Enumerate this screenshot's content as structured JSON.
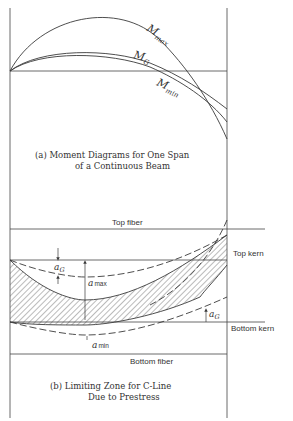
{
  "figure": {
    "part_a": {
      "caption_line1": "(a) Moment Diagrams for One Span",
      "caption_line2": "of a Continuous Beam",
      "curves": [
        {
          "name": "M_max",
          "label_main": "M",
          "label_sub": "max"
        },
        {
          "name": "M_G",
          "label_main": "M",
          "label_sub": "G"
        },
        {
          "name": "M_min",
          "label_main": "M",
          "label_sub": "min"
        }
      ]
    },
    "part_b": {
      "caption_line1": "(b) Limiting Zone for C-Line",
      "caption_line2": "Due to Prestress",
      "levels": {
        "top_fiber": "Top fiber",
        "top_kern": "Top kern",
        "bottom_kern": "Bottom kern",
        "bottom_fiber": "Bottom fiber"
      },
      "dimensions": {
        "a_G_top": {
          "main": "a",
          "sub": "G"
        },
        "a_max": {
          "main": "a",
          "sub": "max"
        },
        "a_G_right": {
          "main": "a",
          "sub": "G"
        },
        "a_min": {
          "main": "a",
          "sub": "min"
        }
      }
    },
    "colors": {
      "ink": "#3a3a3a",
      "background": "#ffffff"
    }
  }
}
